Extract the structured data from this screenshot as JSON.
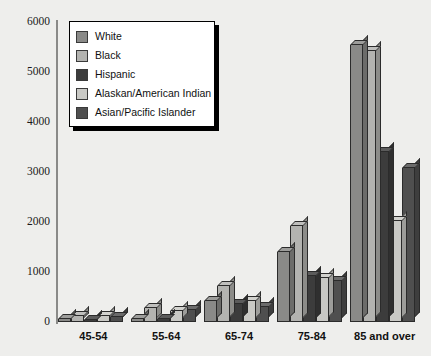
{
  "chart_data": {
    "type": "bar",
    "title": "",
    "subtitle": "",
    "xlabel": "",
    "ylabel": "",
    "ylim": [
      0,
      6000
    ],
    "yticks": [
      0,
      1000,
      2000,
      3000,
      4000,
      5000,
      6000
    ],
    "ytick_labels": [
      "0",
      "1000",
      "2000",
      "3000",
      "4000",
      "5000",
      "6000"
    ],
    "grid": false,
    "legend_position": "upper-left",
    "categories": [
      "45-54",
      "55-64",
      "65-74",
      "75-84",
      "85 and over"
    ],
    "series": [
      {
        "name": "White",
        "color": "#8a8a88",
        "values": [
          60,
          70,
          430,
          1400,
          5550
        ]
      },
      {
        "name": "Black",
        "color": "#b3b3b0",
        "values": [
          130,
          290,
          720,
          1930,
          5420
        ]
      },
      {
        "name": "Hispanic",
        "color": "#3c3c3c",
        "values": [
          50,
          60,
          360,
          930,
          3400
        ]
      },
      {
        "name": "Alaskan/American Indian",
        "color": "#c9c9c5",
        "values": [
          120,
          230,
          430,
          880,
          2030
        ]
      },
      {
        "name": "Asian/Pacific Islander",
        "color": "#4f4f4f",
        "values": [
          100,
          240,
          300,
          830,
          3080
        ]
      }
    ]
  },
  "legend": {
    "items": [
      {
        "label": "White"
      },
      {
        "label": "Black"
      },
      {
        "label": "Hispanic"
      },
      {
        "label": "Alaskan/American Indian"
      },
      {
        "label": "Asian/Pacific Islander"
      }
    ]
  }
}
